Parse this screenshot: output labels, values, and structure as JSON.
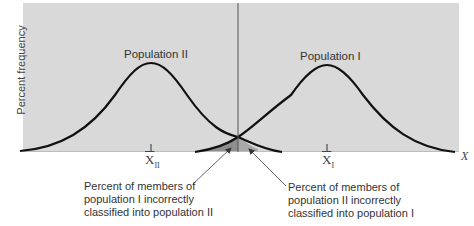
{
  "diagram": {
    "y_axis_label": "Percent frequency",
    "x_axis_label": "X",
    "populations": [
      {
        "name": "Population II",
        "mean_label": "X",
        "mean_sub": "II",
        "mean_x": 151,
        "peak_y": 63
      },
      {
        "name": "Population I",
        "mean_label": "X",
        "mean_sub": "I",
        "mean_x": 327,
        "peak_y": 65
      }
    ],
    "cutoff_line_x": 238,
    "annotations": [
      {
        "lines": [
          "Percent of members of",
          "population I incorrectly",
          "classified into population II"
        ]
      },
      {
        "lines": [
          "Percent of members of",
          "population II incorrectly",
          "classified into population I"
        ]
      }
    ],
    "colors": {
      "panel": "#d9d9d9",
      "curve": "#111111",
      "overlap_shade": "#8a8a8a",
      "text": "#333333"
    }
  }
}
